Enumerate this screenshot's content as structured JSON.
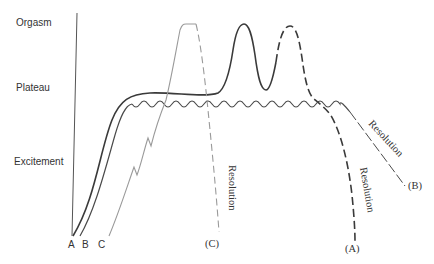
{
  "diagram": {
    "y_axis_labels": {
      "orgasm": "Orgasm",
      "plateau": "Plateau",
      "excitement": "Excitement"
    },
    "start_labels": {
      "a": "A",
      "b": "B",
      "c": "C"
    },
    "end_labels": {
      "a": "(A)",
      "b": "(B)",
      "c": "(C)"
    },
    "resolution_labels": {
      "a": "Resolution",
      "b": "Resolution",
      "c": "Resolution"
    },
    "colors": {
      "curve_a": "#3a3a3a",
      "curve_b": "#4a4a4a",
      "curve_c": "#9a9a9a",
      "axis": "#555555",
      "text": "#333333"
    }
  }
}
